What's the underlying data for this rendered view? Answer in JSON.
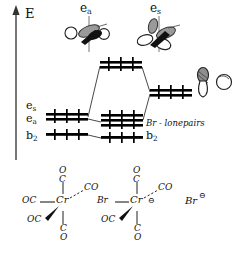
{
  "diagram": {
    "axis": {
      "label": "E",
      "meaning": "energy-increasing-upward"
    },
    "colors": {
      "ink": "#111111",
      "line": "#222222",
      "fill": "#000000"
    },
    "labels": {
      "orbital_cartoon_left": {
        "base": "e",
        "sub": "a"
      },
      "orbital_cartoon_right": {
        "base": "e",
        "sub": "s"
      },
      "left_level_upper": {
        "base": "e",
        "sub": "s"
      },
      "left_level_mid": {
        "base": "e",
        "sub": "a"
      },
      "left_level_lower": {
        "base": "b",
        "sub": "2"
      },
      "center_group": "Br - lonepairs",
      "center_level_lower": {
        "base": "b",
        "sub": "2"
      }
    },
    "levels": [
      {
        "name": "antibonding-e-level",
        "side": "center-top",
        "bars": 2,
        "x": 100,
        "y": 62,
        "w": 42
      },
      {
        "name": "left-e-levels",
        "side": "left",
        "bars": 2,
        "x": 46,
        "y": 115,
        "w": 42
      },
      {
        "name": "left-b2-level",
        "side": "left",
        "bars": 1,
        "x": 46,
        "y": 134,
        "w": 42
      },
      {
        "name": "center-lonepair-levels",
        "side": "center-bottom",
        "bars": 3,
        "x": 101,
        "y": 118,
        "w": 42
      },
      {
        "name": "center-b2-level",
        "side": "center-bottom",
        "bars": 1,
        "x": 101,
        "y": 137,
        "w": 42
      },
      {
        "name": "right-bonding-level",
        "side": "right",
        "bars": 2,
        "x": 150,
        "y": 90,
        "w": 42
      }
    ],
    "correlation_lines": [
      {
        "from": "left-e-levels",
        "to": "antibonding-e-level"
      },
      {
        "from": "left-e-levels",
        "to": "center-lonepair-levels"
      },
      {
        "from": "antibonding-e-level",
        "to": "right-bonding-level"
      },
      {
        "from": "center-lonepair-levels",
        "to": "right-bonding-level"
      },
      {
        "from": "left-b2-level",
        "to": "center-b2-level"
      }
    ],
    "orbital_cartoons": [
      {
        "name": "d-orbital-ea",
        "kind": "d-orbital-two-lobe-with-circles"
      },
      {
        "name": "d-orbital-es",
        "kind": "d-orbital-four-lobe"
      },
      {
        "name": "p-orbital-bromine",
        "kind": "p-orbital-dumbbell"
      },
      {
        "name": "s-orbital-bromine",
        "kind": "s-orbital-sphere"
      }
    ]
  },
  "structures": [
    {
      "name": "chromium-pentacarbonyl",
      "center": "Cr",
      "ligands": [
        {
          "text": "C",
          "sub": "O",
          "position": "top",
          "stacked": "O over C"
        },
        {
          "text": "OC",
          "position": "left",
          "bond": "plain"
        },
        {
          "text": "CO",
          "position": "upper-right",
          "bond": "dashed"
        },
        {
          "text": "OC",
          "position": "lower-left",
          "bond": "wedge"
        },
        {
          "text": "CO",
          "position": "bottom",
          "stacked": "C over O"
        }
      ],
      "charge": ""
    },
    {
      "name": "bromo-chromium-pentacarbonyl-anion",
      "center": "Cr",
      "ligands": [
        {
          "text": "C",
          "sub": "O",
          "position": "top",
          "stacked": "O over C"
        },
        {
          "text": "Br",
          "position": "left",
          "bond": "plain"
        },
        {
          "text": "CO",
          "position": "upper-right",
          "bond": "dashed"
        },
        {
          "text": "OC",
          "position": "lower-left",
          "bond": "wedge"
        },
        {
          "text": "CO",
          "position": "bottom",
          "stacked": "C over O"
        }
      ],
      "charge": "⊖"
    },
    {
      "name": "bromide-anion",
      "center": "Br",
      "ligands": [],
      "charge": "⊖"
    }
  ],
  "atom_text": {
    "O": "O",
    "C": "C",
    "OC": "OC",
    "CO": "CO",
    "Cr": "Cr",
    "Br": "Br",
    "minus_circle": "⊖"
  }
}
